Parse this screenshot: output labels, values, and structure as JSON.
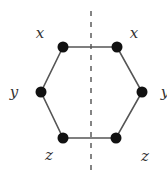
{
  "diagram": {
    "colors": {
      "edge": "#555555",
      "node": "#111111",
      "axis": "#666666",
      "label": "#333333",
      "background": "#ffffff"
    },
    "axis": {
      "x": 91,
      "y1": 11,
      "y2": 176,
      "style": "dashed"
    },
    "nodes": [
      {
        "id": "top-left",
        "x": 63,
        "y": 47,
        "r": 5.5
      },
      {
        "id": "top-right",
        "x": 117,
        "y": 47,
        "r": 5.5
      },
      {
        "id": "mid-right",
        "x": 142,
        "y": 92,
        "r": 5.5
      },
      {
        "id": "bottom-right",
        "x": 116,
        "y": 138,
        "r": 5.5
      },
      {
        "id": "bottom-left",
        "x": 63,
        "y": 138,
        "r": 5.5
      },
      {
        "id": "mid-left",
        "x": 41,
        "y": 92,
        "r": 5.5
      }
    ],
    "labels": [
      {
        "id": "label-top-left",
        "text": "x",
        "x": 40,
        "y": 33
      },
      {
        "id": "label-top-right",
        "text": "x",
        "x": 134,
        "y": 33
      },
      {
        "id": "label-mid-left",
        "text": "y",
        "x": 14,
        "y": 92
      },
      {
        "id": "label-mid-right",
        "text": "y",
        "x": 165,
        "y": 92
      },
      {
        "id": "label-bottom-left",
        "text": "z",
        "x": 49,
        "y": 155
      },
      {
        "id": "label-bottom-right",
        "text": "z",
        "x": 145,
        "y": 156
      }
    ]
  }
}
